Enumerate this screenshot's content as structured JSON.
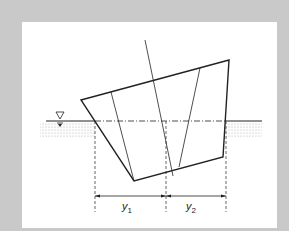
{
  "figure": {
    "background_color": "#c9c9c9",
    "panel_color": "#ffffff",
    "line_color": "#222222",
    "labels": {
      "y1": "y",
      "y1_sub": "1",
      "y2": "y",
      "y2_sub": "2"
    },
    "water_symbol": "▽"
  }
}
